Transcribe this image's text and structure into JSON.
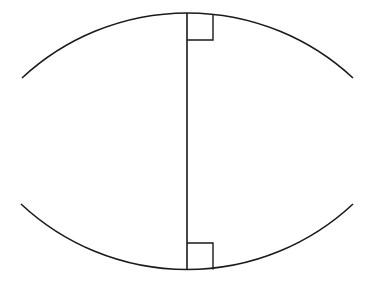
{
  "diagram": {
    "stroke_color": "#1a1a1a",
    "background": "#ffffff",
    "upper_arc": {
      "start": [
        22,
        78
      ],
      "apex": [
        187,
        13
      ],
      "end": [
        353,
        78
      ],
      "radius": 243
    },
    "lower_arc": {
      "start": [
        21,
        204
      ],
      "apex": [
        187,
        270
      ],
      "end": [
        353,
        204
      ],
      "radius": 243
    },
    "perpendicular_segment": {
      "x": 187,
      "y1": 13,
      "y2": 270
    },
    "right_angle_markers": [
      {
        "position": "top",
        "x": 187,
        "y": 13,
        "size": 26
      },
      {
        "position": "bottom",
        "x": 187,
        "y": 243,
        "size": 26
      }
    ],
    "labels": []
  }
}
